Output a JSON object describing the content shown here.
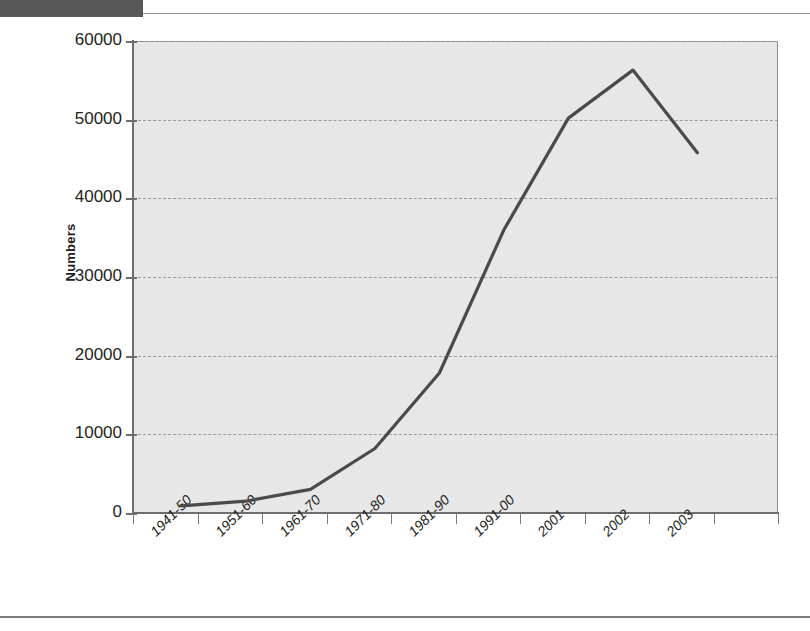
{
  "chart_data": {
    "type": "line",
    "title": "",
    "xlabel": "",
    "ylabel": "Numbers",
    "categories": [
      "1941-50",
      "1951-60",
      "1961-70",
      "1971-80",
      "1981-90",
      "1991-00",
      "2001",
      "2002",
      "2003"
    ],
    "values": [
      900,
      1500,
      3000,
      8200,
      17800,
      36000,
      50200,
      56300,
      45800
    ],
    "series": [
      {
        "name": "Numbers",
        "values": [
          900,
          1500,
          3000,
          8200,
          17800,
          36000,
          50200,
          56300,
          45800
        ],
        "color": "#4a4a4a"
      }
    ],
    "ylim": [
      0,
      60000
    ],
    "y_ticks": [
      0,
      10000,
      20000,
      30000,
      40000,
      50000,
      60000
    ],
    "y_tick_labels": [
      "0",
      "10000",
      "20000",
      "30000",
      "40000",
      "50000",
      "60000"
    ],
    "grid": true,
    "grid_style": "dashed-horizontal",
    "legend": false,
    "legend_position": "none",
    "plot_background": "#e7e7e7",
    "line_color": "#4a4a4a",
    "axis_color": "#6d6d6d",
    "x_tick_label_rotation": "-45"
  },
  "figure": {
    "y_axis_title": "Numbers"
  }
}
